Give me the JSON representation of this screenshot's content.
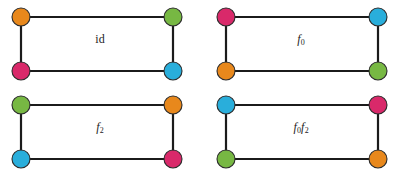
{
  "figure": {
    "background_color": "#ffffff",
    "edge_color": "#1b1b1b",
    "node_outline_color": "#2b2b2b",
    "node_radius": 9,
    "palette": {
      "orange": "#E8881C",
      "green": "#77B843",
      "pink": "#D9296A",
      "blue": "#29AEDB"
    },
    "panels": [
      {
        "id": "p0",
        "label": "id",
        "label_style": "upright",
        "corners": {
          "top_left": "orange",
          "top_right": "green",
          "bottom_left": "pink",
          "bottom_right": "blue"
        }
      },
      {
        "id": "p1",
        "label": "f",
        "label_sub": "0",
        "label_style": "italic",
        "corners": {
          "top_left": "pink",
          "top_right": "blue",
          "bottom_left": "orange",
          "bottom_right": "green"
        }
      },
      {
        "id": "p2",
        "label": "f",
        "label_sub": "2",
        "label_style": "italic",
        "corners": {
          "top_left": "green",
          "top_right": "orange",
          "bottom_left": "blue",
          "bottom_right": "pink"
        }
      },
      {
        "id": "p3",
        "label": "f",
        "label_sub": "0",
        "label2": "f",
        "label2_sub": "2",
        "label_style": "italic",
        "corners": {
          "top_left": "blue",
          "top_right": "pink",
          "bottom_left": "green",
          "bottom_right": "orange"
        }
      }
    ]
  }
}
